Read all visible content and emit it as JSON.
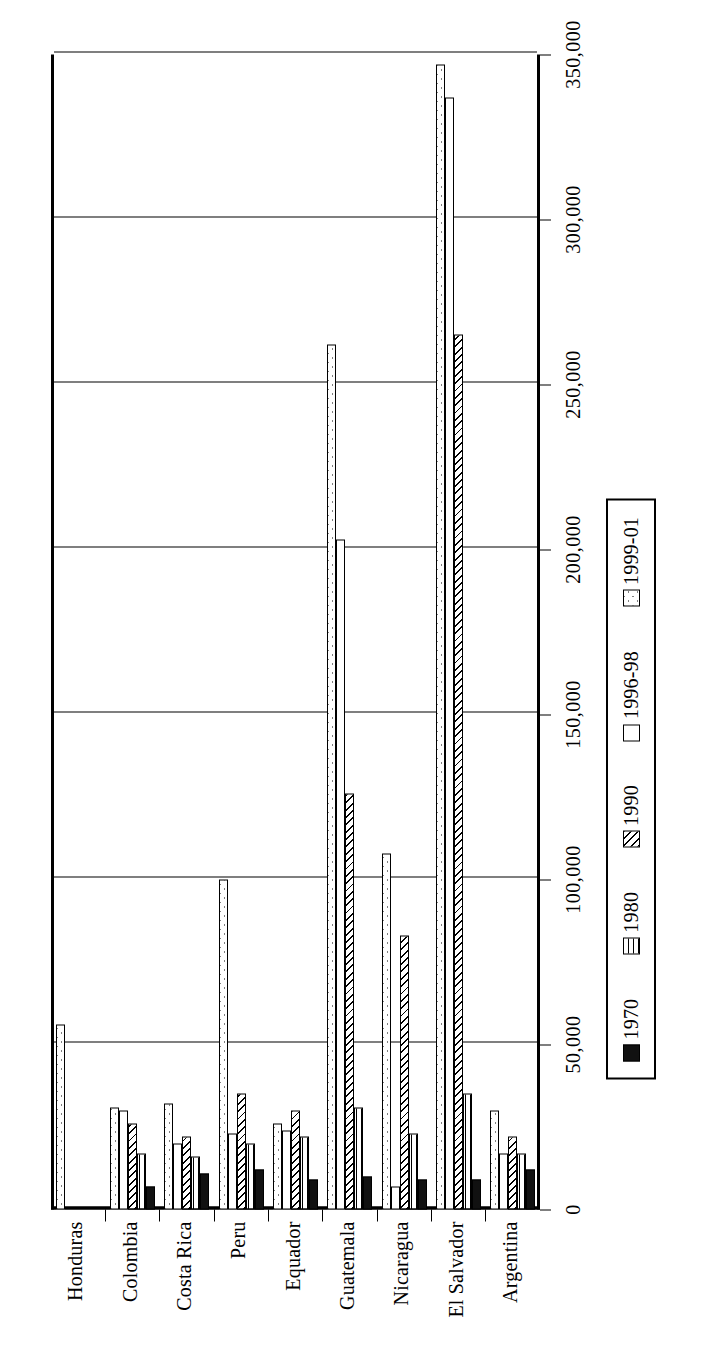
{
  "chart_data": {
    "type": "bar",
    "orientation": "horizontal",
    "title": "",
    "subtitle": "",
    "xlabel": "",
    "ylabel": "",
    "grid": true,
    "legend_position": "right",
    "value_axis": {
      "min": 0,
      "max": 350000,
      "step": 50000,
      "ticks": [
        0,
        50000,
        100000,
        150000,
        200000,
        250000,
        300000,
        350000
      ],
      "tick_labels": [
        "0",
        "50,000",
        "100,000",
        "150,000",
        "200,000",
        "250,000",
        "300,000",
        "350,000"
      ]
    },
    "categories": [
      "Argentina",
      "El Salvador",
      "Nicaragua",
      "Guatemala",
      "Equador",
      "Peru",
      "Costa Rica",
      "Colombia",
      "Honduras"
    ],
    "series": [
      {
        "name": "1970",
        "pattern": "solid-black",
        "values": [
          12000,
          9000,
          9000,
          10000,
          9000,
          12000,
          11000,
          7000,
          0
        ]
      },
      {
        "name": "1980",
        "pattern": "horizontal-lines",
        "values": [
          17000,
          35000,
          23000,
          31000,
          22000,
          20000,
          16000,
          17000,
          0
        ]
      },
      {
        "name": "1990",
        "pattern": "diagonal-hatch",
        "values": [
          22000,
          265000,
          83000,
          126000,
          30000,
          35000,
          22000,
          26000,
          0
        ]
      },
      {
        "name": "1996-98",
        "pattern": "white-empty",
        "values": [
          17000,
          337000,
          7000,
          203000,
          24000,
          23000,
          20000,
          30000,
          0
        ]
      },
      {
        "name": "1999-01",
        "pattern": "dotted",
        "values": [
          30000,
          347000,
          108000,
          262000,
          26000,
          100000,
          32000,
          31000,
          56000
        ]
      }
    ]
  },
  "legend": {
    "items": [
      {
        "label": "1970"
      },
      {
        "label": "1980"
      },
      {
        "label": "1990"
      },
      {
        "label": "1996-98"
      },
      {
        "label": "1999-01"
      }
    ]
  }
}
